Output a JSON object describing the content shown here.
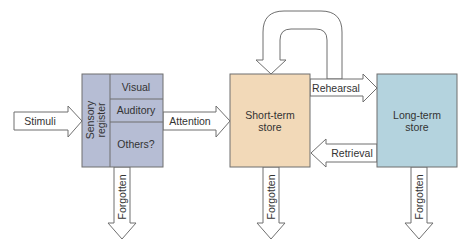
{
  "diagram": {
    "colors": {
      "sensory": "#b6bdd4",
      "short_term": "#f2d9b8",
      "long_term": "#b4d3de",
      "stroke": "#6f6f6f",
      "arrow_fill": "#ffffff",
      "text": "#333333"
    },
    "nodes": {
      "sensory_register": {
        "label_line1": "Sensory",
        "label_line2": "register",
        "rows": [
          "Visual",
          "Auditory",
          "Others?"
        ]
      },
      "short_term": {
        "label_line1": "Short-term",
        "label_line2": "store"
      },
      "long_term": {
        "label_line1": "Long-term",
        "label_line2": "store"
      }
    },
    "arrows": {
      "stimuli": "Stimuli",
      "attention": "Attention",
      "rehearsal": "Rehearsal",
      "retrieval": "Retrieval",
      "forgotten_sensory": "Forgotten",
      "forgotten_short_term": "Forgotten",
      "forgotten_long_term": "Forgotten"
    }
  }
}
